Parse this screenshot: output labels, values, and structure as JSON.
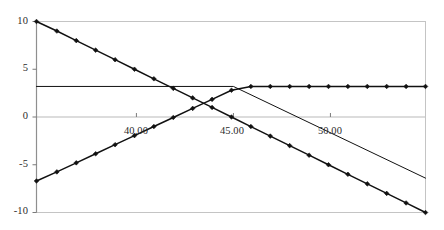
{
  "chart_data": {
    "type": "line",
    "title": "",
    "subtitle": "",
    "xlabel": "",
    "ylabel": "",
    "xlim": [
      34.85,
      54.9
    ],
    "ylim": [
      -10,
      10
    ],
    "grid": true,
    "grid_lines_y": [
      10,
      0
    ],
    "legend": "none",
    "x_ticks": [
      40,
      45,
      50
    ],
    "x_tick_labels": [
      "40.00",
      "45.00",
      "50.00"
    ],
    "y_ticks": [
      10,
      5,
      0,
      -5,
      -10
    ],
    "y_tick_labels": [
      "10",
      "5",
      "0",
      "-5",
      "-10"
    ],
    "cap_value": 3.2,
    "series": [
      {
        "name": "descending-payoff",
        "style": "line-with-markers",
        "color": "#111111",
        "marker": "diamond",
        "x": [
          34.85,
          35.9,
          36.9,
          37.9,
          38.9,
          39.9,
          40.9,
          41.9,
          42.9,
          43.9,
          44.9,
          45.9,
          46.9,
          47.9,
          48.9,
          49.9,
          50.9,
          51.9,
          52.9,
          53.9,
          54.9
        ],
        "values": [
          10,
          9,
          8,
          7,
          6,
          5,
          4,
          3,
          2,
          1,
          0,
          -1,
          -2,
          -3,
          -4,
          -5,
          -6,
          -7,
          -8,
          -9,
          -10
        ]
      },
      {
        "name": "ascending-capped-payoff",
        "style": "line-with-markers",
        "color": "#111111",
        "marker": "diamond",
        "x": [
          34.85,
          35.9,
          36.9,
          37.9,
          38.9,
          39.9,
          40.9,
          41.9,
          42.9,
          43.9,
          44.9,
          45.9,
          46.9,
          47.9,
          48.9,
          49.9,
          50.9,
          51.9,
          52.9,
          53.9,
          54.9
        ],
        "values": [
          -6.7,
          -5.75,
          -4.8,
          -3.85,
          -2.9,
          -1.95,
          -1.0,
          -0.05,
          0.9,
          1.85,
          2.8,
          3.2,
          3.2,
          3.2,
          3.2,
          3.2,
          3.2,
          3.2,
          3.2,
          3.2,
          3.2
        ]
      },
      {
        "name": "reference-straight-line",
        "style": "line",
        "color": "#111111",
        "marker": "none",
        "x": [
          34.85,
          45.0,
          54.9
        ],
        "values": [
          3.2,
          3.2,
          -6.4
        ]
      }
    ]
  },
  "axes": {
    "x_tick_text": [
      "40.00",
      "45.00",
      "50.00"
    ],
    "y_tick_text": [
      "10",
      "5",
      "0",
      "-5",
      "-10"
    ]
  }
}
